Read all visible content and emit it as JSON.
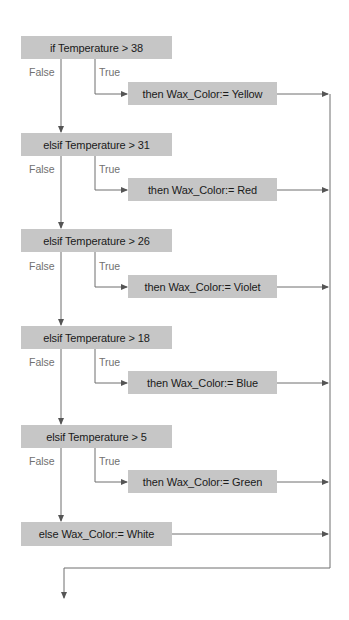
{
  "diagram": {
    "type": "flowchart",
    "colors": {
      "box_fill": "#c6c6c6",
      "line": "#6e6e6e",
      "text": "#1a1a1a",
      "label": "#707070"
    },
    "branch_labels": {
      "false": "False",
      "true": "True"
    },
    "conditions": [
      {
        "text": "if Temperature > 38",
        "then": "then Wax_Color:= Yellow"
      },
      {
        "text": "elsif Temperature > 31",
        "then": "then Wax_Color:= Red"
      },
      {
        "text": "elsif Temperature > 26",
        "then": "then Wax_Color:= Violet"
      },
      {
        "text": "elsif Temperature > 18",
        "then": "then Wax_Color:= Blue"
      },
      {
        "text": "elsif Temperature > 5",
        "then": "then Wax_Color:= Green"
      }
    ],
    "else": "else Wax_Color:= White"
  }
}
